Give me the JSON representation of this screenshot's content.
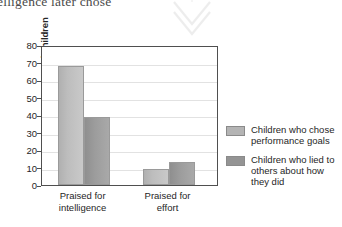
{
  "page": {
    "cut_off_text": "elligence later chose",
    "watermark_icon": "double-chevron-down-icon"
  },
  "chart_data": {
    "type": "bar",
    "title": "",
    "xlabel": "",
    "ylabel": "Percentage of children",
    "ylim": [
      0,
      80
    ],
    "ytick_step": 10,
    "yticks": [
      0,
      10,
      20,
      30,
      40,
      50,
      60,
      70,
      80
    ],
    "grid": true,
    "legend_position": "right",
    "categories": [
      "Praised for intelligence",
      "Praised for effort"
    ],
    "series": [
      {
        "name": "Children who chose performance goals",
        "color": "#b4b4b4",
        "values": [
          68,
          9
        ]
      },
      {
        "name": "Children who lied to others about how they did",
        "color": "#949494",
        "values": [
          39,
          13
        ]
      }
    ]
  },
  "axis": {
    "y_title": "Percentage of children",
    "y_labels": [
      "80",
      "70",
      "60",
      "50",
      "40",
      "30",
      "20",
      "10",
      "0"
    ],
    "x_labels": [
      {
        "line1": "Praised for",
        "line2": "intelligence"
      },
      {
        "line1": "Praised for",
        "line2": "effort"
      }
    ]
  },
  "legend": {
    "items": [
      {
        "swatch": "legend-swatch-performance-goals",
        "line1": "Children who chose",
        "line2": "performance goals",
        "line3": ""
      },
      {
        "swatch": "legend-swatch-lied-to-others",
        "line1": "Children who lied to",
        "line2": "others about how",
        "line3": "they did"
      }
    ]
  }
}
